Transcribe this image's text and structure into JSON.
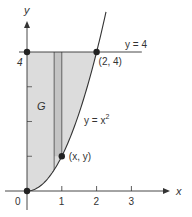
{
  "figure": {
    "kind": "region-under-curve",
    "colors": {
      "ink": "#333333",
      "region_fill": "#dcdcdc",
      "strip_fill": "#c4c4c4",
      "background": "#ffffff"
    },
    "axes": {
      "x_label": "x",
      "y_label": "y",
      "x_range": [
        0,
        3.6
      ],
      "y_range": [
        0,
        4.9
      ],
      "x_ticks": [
        {
          "value": 0,
          "label": "0"
        },
        {
          "value": 1,
          "label": "1"
        },
        {
          "value": 2,
          "label": "2"
        },
        {
          "value": 3,
          "label": "3"
        }
      ],
      "y_ticks": [
        {
          "value": 1,
          "label": ""
        },
        {
          "value": 2,
          "label": ""
        },
        {
          "value": 3,
          "label": ""
        },
        {
          "value": 4,
          "label": "4"
        }
      ]
    },
    "curve": {
      "equation": "y = x²",
      "label_main": "y = x",
      "label_sup": "2",
      "x_domain": [
        0,
        2.27
      ]
    },
    "line": {
      "label": "y = 4",
      "y": 4,
      "x_extent": [
        0,
        3.3
      ]
    },
    "region": {
      "label": "G",
      "bounds": "between y = x² and y = 4, x ≥ 0"
    },
    "strip": {
      "x_from": 0.78,
      "x_to": 1.0
    },
    "points": [
      {
        "name": "origin",
        "x": 0,
        "y": 0,
        "label": ""
      },
      {
        "name": "point-0-4",
        "x": 0,
        "y": 4,
        "label": ""
      },
      {
        "name": "point-2-4",
        "x": 2,
        "y": 4,
        "label": "(2, 4)"
      },
      {
        "name": "point-x-y",
        "x": 1,
        "y": 1,
        "label": "(x, y)"
      }
    ]
  }
}
